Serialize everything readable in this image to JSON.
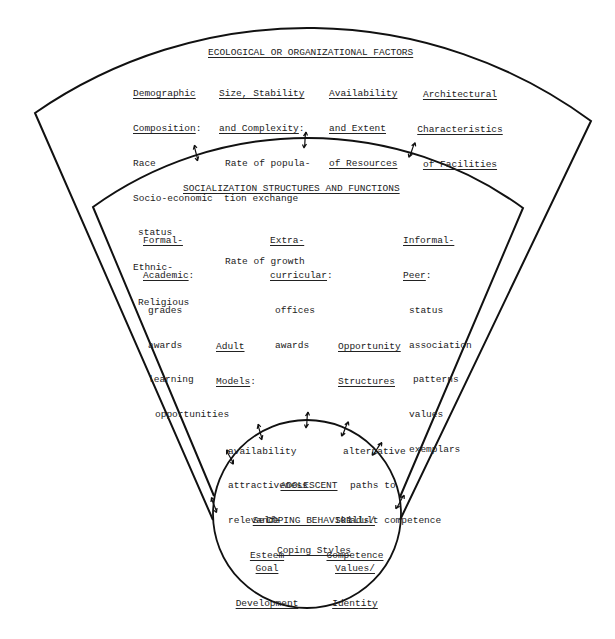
{
  "colors": {
    "line": "#111111",
    "text": "#222222",
    "background": "#ffffff"
  },
  "ecological": {
    "title": "ECOLOGICAL OR ORGANIZATIONAL FACTORS",
    "demographic": {
      "heading": [
        "Demographic",
        "Composition"
      ],
      "suffix": ":",
      "items": [
        "Race",
        "Socio-economic",
        "status",
        "Ethnic-",
        "Religious"
      ]
    },
    "size": {
      "heading": [
        "Size, Stability",
        "and Complexity"
      ],
      "suffix": ":",
      "items": [
        "Rate of popula-",
        "tion exchange",
        "Rate of growth"
      ]
    },
    "resources": {
      "heading": [
        "Availability",
        "and Extent",
        "of Resources"
      ]
    },
    "facilities": {
      "heading": [
        "Architectural",
        "Characteristics",
        "of Facilities"
      ]
    }
  },
  "socialization": {
    "title": "SOCIALIZATION STRUCTURES AND FUNCTIONS",
    "formal": {
      "heading": [
        "Formal-",
        "Academic"
      ],
      "suffix": ":",
      "items": [
        "grades",
        "awards",
        "learning",
        "opportunities"
      ]
    },
    "extra": {
      "heading": [
        "Extra-",
        "curricular"
      ],
      "suffix": ":",
      "items": [
        "offices",
        "awards"
      ]
    },
    "informal": {
      "heading": [
        "Informal-",
        "Peer"
      ],
      "suffix": ":",
      "items": [
        "status",
        "association",
        "patterns",
        "values",
        "exemplars"
      ]
    },
    "adult": {
      "heading": [
        "Adult",
        "Models"
      ],
      "suffix": ":",
      "items": [
        "availability",
        "attractiveness",
        "relevance"
      ]
    },
    "opportunity": {
      "heading": [
        "Opportunity",
        "Structures"
      ],
      "items": [
        "alternative",
        "paths to",
        "adult competence"
      ]
    }
  },
  "adolescent": {
    "title": [
      "ADOLESCENT",
      "COPING BEHAVIOR"
    ],
    "self_esteem": [
      "Self-",
      "Esteem"
    ],
    "skills": [
      "Skills/",
      "Competence"
    ],
    "coping_styles": "Coping Styles",
    "goal": [
      "Goal",
      "Development"
    ],
    "values": [
      "Values/",
      "Identity"
    ]
  },
  "connectors": {
    "icon": "bidirectional-arrow-icon",
    "count": 10
  }
}
